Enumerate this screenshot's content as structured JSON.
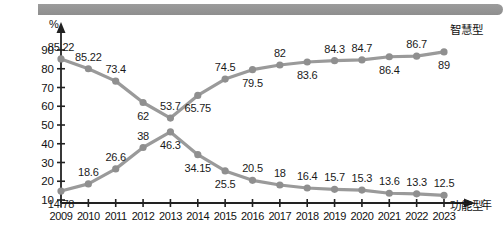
{
  "chart_data": {
    "type": "line",
    "title": "",
    "xlabel": "年",
    "ylabel": "%",
    "ylim": [
      0,
      95
    ],
    "grid": false,
    "legend_position": "line-end-right",
    "categories": [
      "2009",
      "2010",
      "2011",
      "2012",
      "2013",
      "2014",
      "2015",
      "2016",
      "2017",
      "2018",
      "2019",
      "2020",
      "2021",
      "2022",
      "2023"
    ],
    "series": [
      {
        "name": "智慧型",
        "label_position": "alternating",
        "values": [
          85.22,
          80.0,
          73.4,
          62.0,
          53.7,
          65.75,
          74.5,
          79.5,
          82,
          83.6,
          84.3,
          84.7,
          86.4,
          86.7,
          89
        ],
        "point_labels": [
          "85.22",
          "85.22",
          "73.4",
          "62",
          "53.7",
          "65.75",
          "74.5",
          "79.5",
          "82",
          "83.6",
          "84.3",
          "84.7",
          "86.4",
          "86.7",
          "89"
        ]
      },
      {
        "name": "功能型",
        "label_position": "alternating",
        "values": [
          14.78,
          18.6,
          26.6,
          38.0,
          46.3,
          34.15,
          25.5,
          20.5,
          18,
          16.4,
          15.7,
          15.3,
          13.6,
          13.3,
          12.5
        ],
        "point_labels": [
          "14.78",
          "18.6",
          "26.6",
          "38",
          "46.3",
          "34.15",
          "25.5",
          "20.5",
          "18",
          "16.4",
          "15.7",
          "15.3",
          "13.6",
          "13.3",
          "12.5"
        ]
      }
    ],
    "yticks": [
      "10",
      "20",
      "30",
      "40",
      "50",
      "60",
      "70",
      "80",
      "90"
    ],
    "colors": {
      "line": "#9a9a9a",
      "marker": "#8f8f8f",
      "axis": "#222222",
      "text": "#111111",
      "header_bar": "#979797"
    }
  }
}
